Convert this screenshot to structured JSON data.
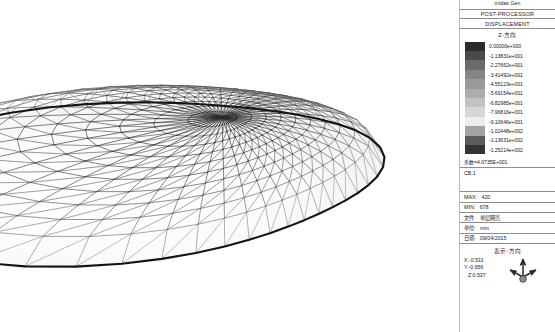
{
  "app": {
    "brand": "midas Gen",
    "module": "POST-PROCESSOR",
    "result_type": "DISPLACEMENT",
    "component": "Z-方向"
  },
  "legend": {
    "title": "Z-方向",
    "coefficient_label": "系数=4.0735E+001",
    "entries": [
      {
        "value": "0.00000e+000",
        "color": "#2b2b2b"
      },
      {
        "value": "-1.13831e+001",
        "color": "#4a4a4a"
      },
      {
        "value": "-2.27662e+001",
        "color": "#6b6b6b"
      },
      {
        "value": "-3.41492e+001",
        "color": "#858585"
      },
      {
        "value": "-4.55123e+001",
        "color": "#9a9a9a"
      },
      {
        "value": "-5.69154e+001",
        "color": "#adadad"
      },
      {
        "value": "-6.82985e+001",
        "color": "#c2c2c2"
      },
      {
        "value": "-7.96816e+001",
        "color": "#d6d6d6"
      },
      {
        "value": "-9.10646e+001",
        "color": "#ededed"
      },
      {
        "value": "-1.02448e+002",
        "color": "#a3a3a3"
      },
      {
        "value": "-1.13631e+002",
        "color": "#5c5c5c"
      },
      {
        "value": "-1.25214e+002",
        "color": "#333333"
      }
    ]
  },
  "combo": {
    "label": "CB.1"
  },
  "info": {
    "max_key": "MAX:",
    "max_value": "420",
    "min_key": "MIN:",
    "min_value": "678",
    "file_key": "文件:",
    "file_value": "单层网壳",
    "unit_key": "单位:",
    "unit_value": "mm",
    "date_key": "日期:",
    "date_value": "09/04/2015"
  },
  "orientation": {
    "title": "表示-方向",
    "x": "X:-0.531",
    "y": "Y:-0.656",
    "z": "Z:0.537",
    "icon": "axis-triad-icon"
  },
  "model": {
    "name": "单层网壳 triangulated reticulated shell",
    "description": "Egg-shaped single-layer lattice dome, triangulated radial-concentric mesh, displayed in isometric view with greyscale displacement contour shading."
  }
}
